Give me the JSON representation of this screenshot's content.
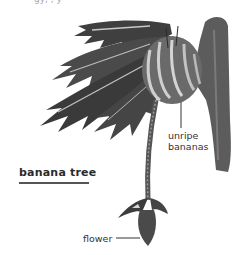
{
  "diagram": {
    "title": "banana tree",
    "labels": {
      "unripe_line1": "unripe",
      "unripe_line2": "bananas",
      "flower": "flower"
    },
    "top_clipped_text": "gy,  ,    y",
    "colors": {
      "background": "#ffffff",
      "text": "#333333",
      "leaf_dark": "#3a3a3a",
      "leaf_mid": "#6a6a6a",
      "leaf_light": "#bdbdbd",
      "trunk": "#5a5a5a",
      "title_underline": "#555555"
    }
  }
}
